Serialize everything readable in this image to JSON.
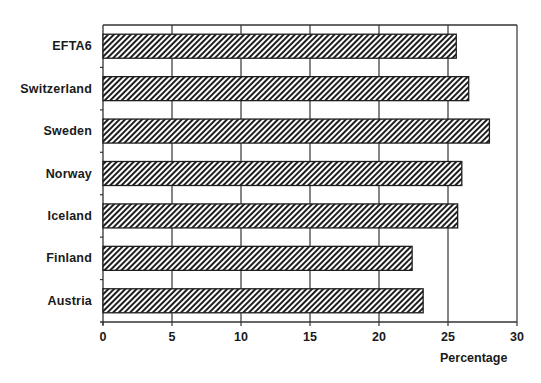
{
  "chart_data": {
    "type": "bar",
    "orientation": "horizontal",
    "title": "",
    "xlabel": "Percentage",
    "ylabel": "",
    "categories": [
      "EFTA6",
      "Switzerland",
      "Sweden",
      "Norway",
      "Iceland",
      "Finland",
      "Austria"
    ],
    "values": [
      25.6,
      26.5,
      28.0,
      26.0,
      25.7,
      22.4,
      23.2
    ],
    "xlim": [
      0,
      30
    ],
    "xticks": [
      0,
      5,
      10,
      15,
      20,
      25,
      30
    ],
    "grid": {
      "vertical": true,
      "horizontal": false
    },
    "legend": null,
    "bar_style": {
      "fill": "diagonal-hatch",
      "hatch_color": "#222222",
      "background": "#ffffff",
      "border": "#222222"
    }
  },
  "layout": {
    "plot_left": 103,
    "plot_right": 517,
    "plot_top": 25,
    "plot_bottom": 322,
    "bar_height": 24
  },
  "colors": {
    "axis": "#333333",
    "grid": "#333333",
    "hatch": "#1e1e1e",
    "text": "#1a1a1a"
  }
}
